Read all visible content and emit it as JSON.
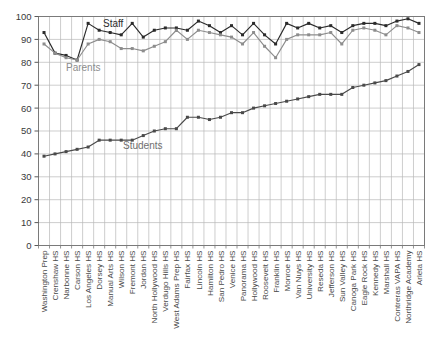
{
  "chart_data": {
    "type": "line",
    "title": "",
    "xlabel": "",
    "ylabel": "",
    "ylim": [
      0,
      100
    ],
    "ytick_step": 10,
    "yticks": [
      0,
      10,
      20,
      30,
      40,
      50,
      60,
      70,
      80,
      90,
      100
    ],
    "grid": true,
    "legend_position": "inline-annotations",
    "categories": [
      "Washington Prep",
      "Crenshaw HS",
      "Narbonne HS",
      "Carson HS",
      "Los Angeles HS",
      "Dorsey HS",
      "Manual Arts HS",
      "Wilson HS",
      "Fremont HS",
      "Jordan HS",
      "North Hollywood HS",
      "Verdugo Hills HS",
      "West Adams Prep HS",
      "Fairfax HS",
      "Lincoln HS",
      "Hamilton HS",
      "San Pedro HS",
      "Venice HS",
      "Panorama HS",
      "Hollywood HS",
      "Roosevelt HS",
      "Franklin HS",
      "Monroe HS",
      "Van Nuys HS",
      "University HS",
      "Reseda HS",
      "Jefferson HS",
      "Sun Valley HS",
      "Canoga Park HS",
      "Eagle Rock HS",
      "Kennedy HS",
      "Marshall HS",
      "Contreras VAPA HS",
      "Northridge Academy",
      "Arleta HS"
    ],
    "series": [
      {
        "name": "Staff",
        "color": "#2b2b2b",
        "values": [
          93,
          84,
          83,
          81,
          97,
          94,
          93,
          92,
          97,
          91,
          94,
          95,
          95,
          94,
          98,
          96,
          93,
          96,
          92,
          97,
          92,
          88,
          97,
          95,
          97,
          95,
          96,
          93,
          96,
          97,
          97,
          96,
          98,
          99,
          97
        ]
      },
      {
        "name": "Parents",
        "color": "#8d8d8d",
        "values": [
          88,
          84,
          82,
          81,
          88,
          90,
          89,
          86,
          86,
          85,
          87,
          89,
          94,
          90,
          94,
          93,
          92,
          91,
          88,
          93,
          87,
          82,
          90,
          92,
          92,
          92,
          93,
          88,
          94,
          95,
          94,
          92,
          96,
          95,
          93
        ]
      },
      {
        "name": "Students",
        "color": "#4a4a4a",
        "values": [
          39,
          40,
          41,
          42,
          43,
          46,
          46,
          46,
          46,
          48,
          50,
          51,
          51,
          56,
          56,
          55,
          56,
          58,
          58,
          60,
          61,
          62,
          63,
          64,
          65,
          66,
          66,
          66,
          69,
          70,
          71,
          72,
          74,
          76,
          79
        ]
      }
    ],
    "annotations": [
      {
        "text": "Staff",
        "series": "Staff"
      },
      {
        "text": "Parents",
        "series": "Parents"
      },
      {
        "text": "Students",
        "series": "Students"
      }
    ]
  }
}
